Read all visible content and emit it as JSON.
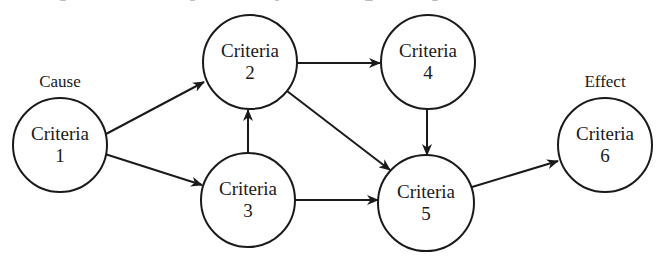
{
  "diagram": {
    "type": "cause-effect flow",
    "labels": {
      "cause": "Cause",
      "effect": "Effect"
    },
    "nodes": [
      {
        "id": "1",
        "title": "Criteria",
        "number": "1",
        "cx": 60,
        "cy": 145,
        "r": 47
      },
      {
        "id": "2",
        "title": "Criteria",
        "number": "2",
        "cx": 250,
        "cy": 62,
        "r": 47
      },
      {
        "id": "3",
        "title": "Criteria",
        "number": "3",
        "cx": 248,
        "cy": 200,
        "r": 47
      },
      {
        "id": "4",
        "title": "Criteria",
        "number": "4",
        "cx": 428,
        "cy": 62,
        "r": 47
      },
      {
        "id": "5",
        "title": "Criteria",
        "number": "5",
        "cx": 426,
        "cy": 203,
        "r": 48
      },
      {
        "id": "6",
        "title": "Criteria",
        "number": "6",
        "cx": 605,
        "cy": 145,
        "r": 47
      }
    ],
    "edges": [
      {
        "from": "1",
        "to": "2"
      },
      {
        "from": "1",
        "to": "3"
      },
      {
        "from": "3",
        "to": "2"
      },
      {
        "from": "2",
        "to": "4"
      },
      {
        "from": "2",
        "to": "5"
      },
      {
        "from": "3",
        "to": "5"
      },
      {
        "from": "4",
        "to": "5"
      },
      {
        "from": "5",
        "to": "6"
      }
    ],
    "colors": {
      "stroke": "#1a1a1a",
      "background": "#ffffff"
    }
  }
}
